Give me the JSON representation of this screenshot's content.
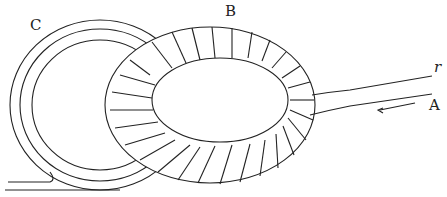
{
  "diagram": {
    "type": "toroidal coil linked with conductor loop",
    "labels": {
      "c": "C",
      "b": "B",
      "r": "r",
      "a": "A"
    },
    "colors": {
      "ink": "#222222",
      "background": "#ffffff"
    }
  }
}
